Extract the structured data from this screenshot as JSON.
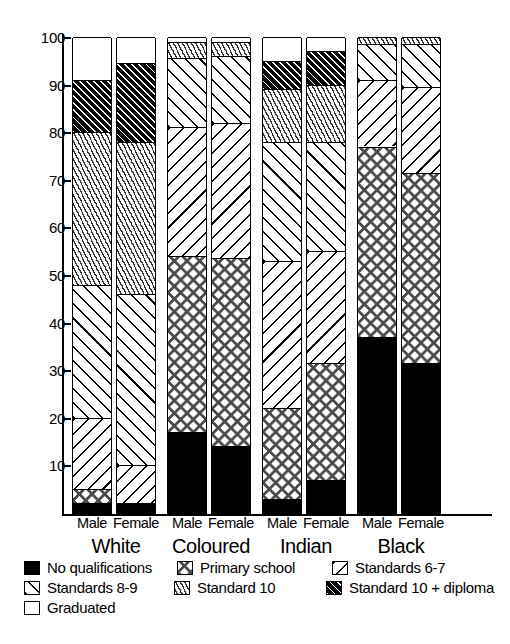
{
  "chart_data": {
    "type": "bar",
    "subtype": "stacked-100-percent",
    "title": "",
    "xlabel": "",
    "ylabel": "",
    "ylim": [
      0,
      100
    ],
    "yticks": [
      10,
      20,
      30,
      40,
      50,
      60,
      70,
      80,
      90,
      100
    ],
    "grid": false,
    "legend_position": "bottom",
    "group_labels": [
      "White",
      "Coloured",
      "Indian",
      "Black"
    ],
    "sex_labels": [
      "Male",
      "Female"
    ],
    "categories": [
      "White Male",
      "White Female",
      "Coloured Male",
      "Coloured Female",
      "Indian Male",
      "Indian Female",
      "Black Male",
      "Black Female"
    ],
    "series": [
      {
        "name": "No qualifications",
        "key": "no-qualifications",
        "pattern": "solid-black",
        "values": [
          2.0,
          2.0,
          17.0,
          14.0,
          3.0,
          7.0,
          37.0,
          31.5
        ]
      },
      {
        "name": "Primary school",
        "key": "primary-school",
        "pattern": "diamond-checker",
        "values": [
          3.0,
          0.0,
          37.0,
          39.5,
          19.0,
          24.5,
          40.0,
          40.0
        ]
      },
      {
        "name": "Standards 6-7",
        "key": "standards-6-7",
        "pattern": "backslash-hatch",
        "values": [
          15.0,
          8.0,
          27.0,
          28.5,
          31.0,
          23.5,
          14.0,
          18.0
        ]
      },
      {
        "name": "Standards 8-9",
        "key": "standards-8-9",
        "pattern": "slash-hatch",
        "values": [
          28.0,
          36.0,
          14.5,
          14.0,
          25.0,
          23.0,
          7.5,
          9.0
        ]
      },
      {
        "name": "Standard 10",
        "key": "standard-10",
        "pattern": "short-dashes",
        "values": [
          32.0,
          32.0,
          3.5,
          3.0,
          11.0,
          12.0,
          1.5,
          1.5
        ]
      },
      {
        "name": "Standard 10 + diploma",
        "key": "standard-10-diploma",
        "pattern": "dense-black-hatch",
        "values": [
          11.0,
          16.5,
          0.0,
          0.0,
          6.0,
          7.0,
          0.0,
          0.0
        ]
      },
      {
        "name": "Graduated",
        "key": "graduated",
        "pattern": "empty-white",
        "values": [
          9.0,
          5.5,
          1.0,
          1.0,
          5.0,
          3.0,
          0.0,
          0.0
        ]
      }
    ],
    "cumulative_tops": {
      "White Male": {
        "no-qualifications": 2.0,
        "primary-school": 5.0,
        "standards-6-7": 20.0,
        "standards-8-9": 48.0,
        "standard-10": 80.0,
        "standard-10-diploma": 91.0,
        "graduated": 100
      },
      "White Female": {
        "no-qualifications": 2.0,
        "primary-school": 2.0,
        "standards-6-7": 10.0,
        "standards-8-9": 46.0,
        "standard-10": 78.0,
        "standard-10-diploma": 94.5,
        "graduated": 100
      },
      "Coloured Male": {
        "no-qualifications": 17.0,
        "primary-school": 54.0,
        "standards-6-7": 81.0,
        "standards-8-9": 95.5,
        "standard-10": 99.0,
        "standard-10-diploma": 99.0,
        "graduated": 100
      },
      "Coloured Female": {
        "no-qualifications": 14.0,
        "primary-school": 53.5,
        "standards-6-7": 82.0,
        "standards-8-9": 96.0,
        "standard-10": 99.0,
        "standard-10-diploma": 99.0,
        "graduated": 100
      },
      "Indian Male": {
        "no-qualifications": 3.0,
        "primary-school": 22.0,
        "standards-6-7": 53.0,
        "standards-8-9": 78.0,
        "standard-10": 89.0,
        "standard-10-diploma": 95.0,
        "graduated": 100
      },
      "Indian Female": {
        "no-qualifications": 7.0,
        "primary-school": 31.5,
        "standards-6-7": 55.0,
        "standards-8-9": 78.0,
        "standard-10": 90.0,
        "standard-10-diploma": 97.0,
        "graduated": 100
      },
      "Black Male": {
        "no-qualifications": 37.0,
        "primary-school": 77.0,
        "standards-6-7": 91.0,
        "standards-8-9": 98.5,
        "standard-10": 100,
        "standard-10-diploma": 100,
        "graduated": 100
      },
      "Black Female": {
        "no-qualifications": 31.5,
        "primary-school": 71.5,
        "standards-6-7": 89.5,
        "standards-8-9": 98.5,
        "standard-10": 100,
        "standard-10-diploma": 100,
        "graduated": 100
      }
    }
  },
  "axis": {
    "ticks": [
      "100",
      "90",
      "80",
      "70",
      "60",
      "50",
      "40",
      "30",
      "20",
      "10"
    ]
  },
  "groups": [
    {
      "name": "White",
      "bars": [
        {
          "sex": "Male"
        },
        {
          "sex": "Female"
        }
      ]
    },
    {
      "name": "Coloured",
      "bars": [
        {
          "sex": "Male"
        },
        {
          "sex": "Female"
        }
      ]
    },
    {
      "name": "Indian",
      "bars": [
        {
          "sex": "Male"
        },
        {
          "sex": "Female"
        }
      ]
    },
    {
      "name": "Black",
      "bars": [
        {
          "sex": "Male"
        },
        {
          "sex": "Female"
        }
      ]
    }
  ],
  "legend": {
    "rows": [
      [
        {
          "label": "No qualifications",
          "key": "no-qualifications"
        },
        {
          "label": "Primary school",
          "key": "primary-school"
        },
        {
          "label": "Standards 6-7",
          "key": "standards-6-7"
        }
      ],
      [
        {
          "label": "Standards 8-9",
          "key": "standards-8-9"
        },
        {
          "label": "Standard 10",
          "key": "standard-10"
        },
        {
          "label": "Standard 10 + diploma",
          "key": "standard-10-diploma"
        }
      ],
      [
        {
          "label": "Graduated",
          "key": "graduated"
        }
      ]
    ]
  },
  "colors": {
    "ink": "#000000",
    "paper": "#ffffff",
    "pattern_gray": "#4a4a4a"
  }
}
